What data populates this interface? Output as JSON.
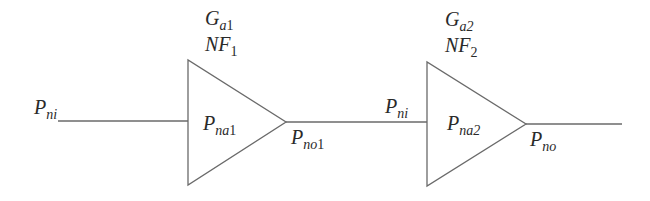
{
  "diagram": {
    "title": "",
    "colors": {
      "stroke": "#6a6a6a",
      "text": "#2a2a2a",
      "background": "#ffffff"
    },
    "input_label": {
      "main": "P",
      "sub_italic": "ni",
      "sub_plain": ""
    },
    "stages": [
      {
        "gain": {
          "main": "G",
          "sub_italic": "a",
          "sub_plain": "1"
        },
        "noise_figure": {
          "main": "NF",
          "sub_italic": "",
          "sub_plain": "1"
        },
        "internal_noise": {
          "main": "P",
          "sub_italic": "na",
          "sub_plain": "1"
        },
        "output_label": {
          "main": "P",
          "sub_italic": "no",
          "sub_plain": "1"
        }
      },
      {
        "input_label": {
          "main": "P",
          "sub_italic": "ni",
          "sub_plain": ""
        },
        "gain": {
          "main": "G",
          "sub_italic": "a2",
          "sub_plain": ""
        },
        "noise_figure": {
          "main": "NF",
          "sub_italic": "",
          "sub_plain": "2"
        },
        "internal_noise": {
          "main": "P",
          "sub_italic": "na2",
          "sub_plain": ""
        },
        "output_label": {
          "main": "P",
          "sub_italic": "no",
          "sub_plain": ""
        }
      }
    ]
  }
}
